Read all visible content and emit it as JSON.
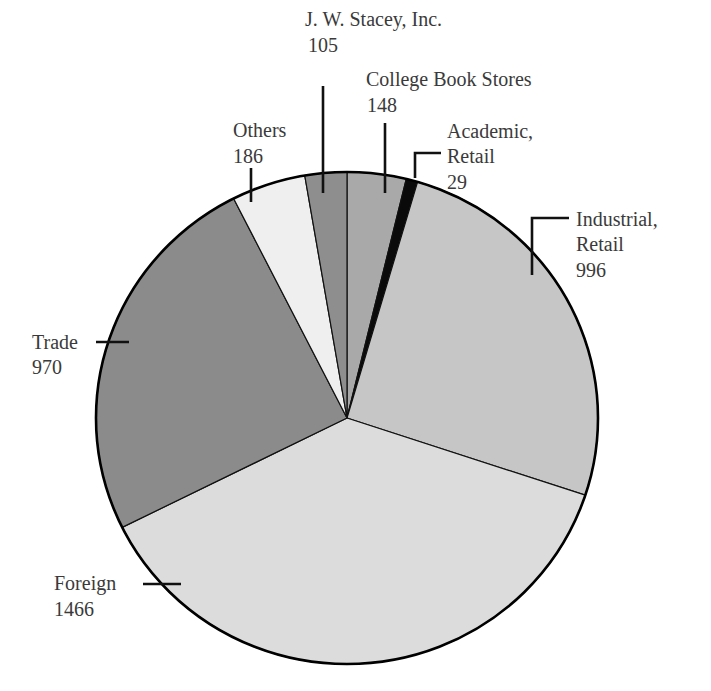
{
  "chart_data": {
    "type": "pie",
    "title": "",
    "total": 3900,
    "start_angle_deg": 0,
    "direction": "clockwise",
    "slices": [
      {
        "label": "College Book Stores",
        "label_lines": [
          "College Book Stores",
          "148"
        ],
        "value": 148,
        "color": "#a9a9a9"
      },
      {
        "label": "Academic, Retail",
        "label_lines": [
          "Academic,",
          "Retail",
          "29"
        ],
        "value": 29,
        "color": "#0a0a0a"
      },
      {
        "label": "Industrial, Retail",
        "label_lines": [
          "Industrial,",
          "Retail",
          "996"
        ],
        "value": 996,
        "color": "#c6c6c6"
      },
      {
        "label": "Foreign",
        "label_lines": [
          "Foreign",
          "1466"
        ],
        "value": 1466,
        "color": "#dcdcdc"
      },
      {
        "label": "Trade",
        "label_lines": [
          "Trade",
          "970"
        ],
        "value": 970,
        "color": "#8b8b8b"
      },
      {
        "label": "Others",
        "label_lines": [
          "Others",
          "186"
        ],
        "value": 186,
        "color": "#efefef"
      },
      {
        "label": "J. W. Stacey, Inc.",
        "label_lines": [
          "J. W. Stacey, Inc.",
          "105"
        ],
        "value": 105,
        "color": "#8e8e8e"
      }
    ],
    "legend": "none (direct labels with leader lines)"
  },
  "labels": {
    "stacey": {
      "name": "J. W. Stacey, Inc.",
      "value": "105"
    },
    "college": {
      "name": "College Book Stores",
      "value": "148"
    },
    "others": {
      "name": "Others",
      "value": "186"
    },
    "academic": {
      "line1": "Academic,",
      "line2": "Retail",
      "value": "29"
    },
    "industrial": {
      "line1": "Industrial,",
      "line2": "Retail",
      "value": "996"
    },
    "trade": {
      "name": "Trade",
      "value": "970"
    },
    "foreign": {
      "name": "Foreign",
      "value": "1466"
    }
  }
}
